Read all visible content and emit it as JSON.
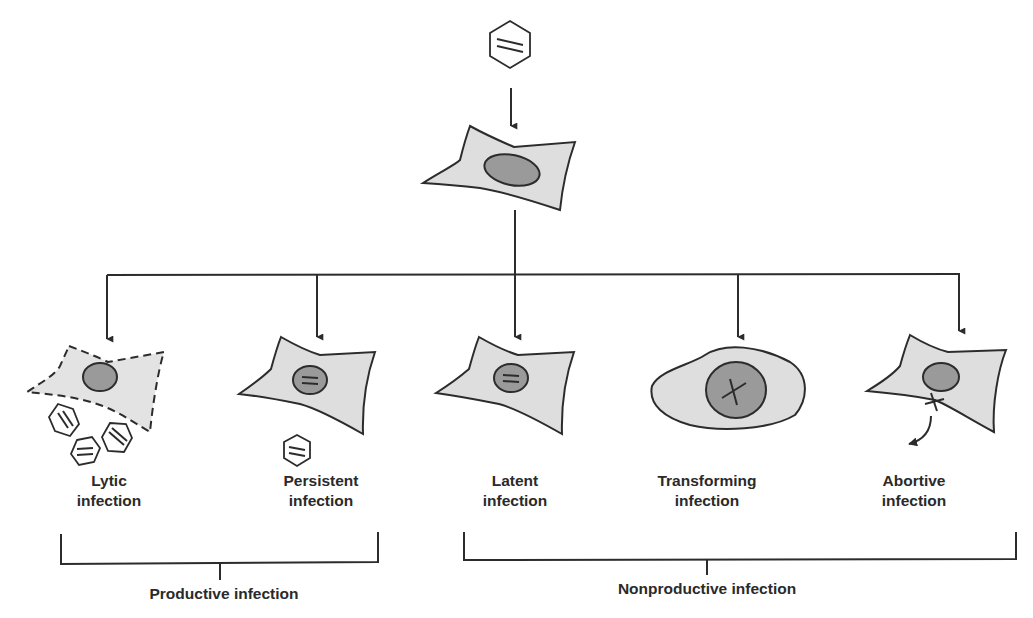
{
  "diagram": {
    "title_virion": "virus particle",
    "host_cell": "infected host cell",
    "outcomes": [
      {
        "id": "lytic",
        "line1": "Lytic",
        "line2": "infection",
        "cell_outline": "dashed",
        "progeny_virions": 3
      },
      {
        "id": "persistent",
        "line1": "Persistent",
        "line2": "infection",
        "cell_outline": "solid",
        "progeny_virions": 1
      },
      {
        "id": "latent",
        "line1": "Latent",
        "line2": "infection",
        "cell_outline": "solid",
        "progeny_virions": 0
      },
      {
        "id": "transforming",
        "line1": "Transforming",
        "line2": "infection",
        "cell_outline": "rounded",
        "progeny_virions": 0
      },
      {
        "id": "abortive",
        "line1": "Abortive",
        "line2": "infection",
        "cell_outline": "solid",
        "progeny_virions": 0
      }
    ],
    "groups": {
      "productive": "Productive infection",
      "nonproductive": "Nonproductive infection"
    }
  },
  "colors": {
    "cell_fill": "#dedede",
    "nucleus_fill": "#9a9a9a",
    "stroke": "#2c2c2c",
    "background": "#ffffff"
  }
}
